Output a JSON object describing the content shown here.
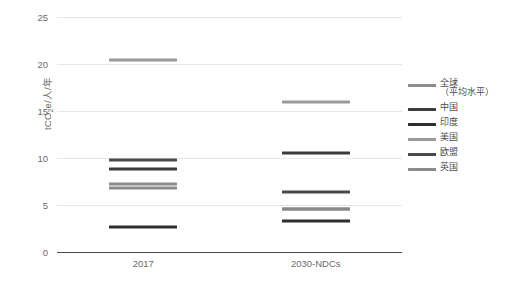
{
  "chart_data": {
    "type": "bar",
    "title": "",
    "subtitle": "",
    "xlabel": "",
    "ylabel": "tCO2e/人/年",
    "ylabel_parts": {
      "prefix": "tCO",
      "sub": "2",
      "suffix": "e/人/年"
    },
    "categories": [
      "2017",
      "2030-NDCs"
    ],
    "ylim": [
      0,
      25
    ],
    "yticks": [
      0,
      5,
      10,
      15,
      20,
      25
    ],
    "ytick_labels": [
      "0",
      "5",
      "10",
      "15",
      "20",
      "25"
    ],
    "grid": true,
    "legend_position": "right",
    "marker_style": "horizontal-dash",
    "series": [
      {
        "name": "全球\n（平均水平）",
        "name_plain": "全球（平均水平）",
        "color": "#8c8c8c",
        "values": [
          6.8,
          4.6
        ]
      },
      {
        "name": "中国",
        "color": "#3b3b3b",
        "values": [
          8.8,
          10.5
        ]
      },
      {
        "name": "印度",
        "color": "#2e2e2e",
        "values": [
          2.7,
          3.3
        ]
      },
      {
        "name": "美国",
        "color": "#9a9a9a",
        "values": [
          20.4,
          16.0
        ]
      },
      {
        "name": "欧盟",
        "color": "#4a4a4a",
        "values": [
          9.8,
          6.4
        ]
      },
      {
        "name": "英国",
        "color": "#8a8a8a",
        "values": [
          7.2,
          4.6
        ]
      }
    ]
  },
  "legend": {
    "items": [
      {
        "label": "全球\n（平均水平）",
        "color": "#8c8c8c"
      },
      {
        "label": "中国",
        "color": "#3b3b3b"
      },
      {
        "label": "印度",
        "color": "#2e2e2e"
      },
      {
        "label": "美国",
        "color": "#9a9a9a"
      },
      {
        "label": "欧盟",
        "color": "#4a4a4a"
      },
      {
        "label": "英国",
        "color": "#8a8a8a"
      }
    ]
  }
}
